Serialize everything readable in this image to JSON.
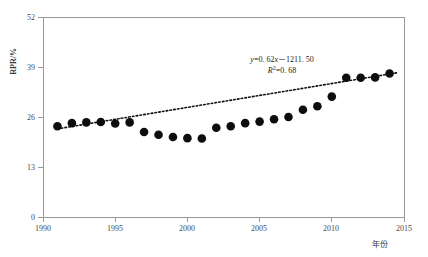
{
  "chart_data": {
    "type": "scatter",
    "title": "",
    "xlabel": "年份",
    "ylabel": "RPR/%",
    "xlim": [
      1990,
      2015
    ],
    "ylim": [
      0,
      52
    ],
    "xticks": [
      1990,
      1995,
      2000,
      2005,
      2010,
      2015
    ],
    "yticks": [
      0,
      13,
      26,
      39,
      52
    ],
    "grid": false,
    "legend": "none",
    "x": [
      1991,
      1992,
      1993,
      1994,
      1995,
      1996,
      1997,
      1998,
      1999,
      2000,
      2001,
      2002,
      2003,
      2004,
      2005,
      2006,
      2007,
      2008,
      2009,
      2010,
      2011,
      2012,
      2013,
      2014
    ],
    "values": [
      23.6,
      24.4,
      24.6,
      24.7,
      24.3,
      24.6,
      22.1,
      21.4,
      20.8,
      20.5,
      20.4,
      23.2,
      23.6,
      24.4,
      24.8,
      25.4,
      26.0,
      27.9,
      28.8,
      31.3,
      36.2,
      36.2,
      36.3,
      37.3
    ],
    "series_name": "RPR",
    "marker": "filled-circle",
    "marker_color": "#0d0d0d",
    "trend": {
      "type": "linear",
      "slope": 0.62,
      "intercept": -1211.5,
      "r_squared": 0.68,
      "style": "dotted",
      "color": "#111111",
      "x_start": 1991,
      "x_end": 2014.6
    },
    "annotations": {
      "equation": "y=0. 62x－1211. 50",
      "equation_parts": {
        "y_sym": "y",
        "eq1": "=0. 62",
        "x_sym": "x",
        "rest": "－1211. 50"
      },
      "r_squared_label": "R",
      "r_squared_sup": "2",
      "r_squared_value": "=0. 68"
    }
  },
  "axes": {
    "y_title": "RPR/%",
    "x_title": "年份",
    "y_tick_labels": [
      "52",
      "39",
      "26",
      "13",
      "0"
    ],
    "x_tick_labels": [
      "1990",
      "1995",
      "2000",
      "2005",
      "2010",
      "2015"
    ]
  },
  "colors": {
    "marker": "#0d0d0d",
    "axis": "#9a9a9a",
    "trend": "#111111",
    "background": "#ffffff",
    "text": "#3a3a3a"
  }
}
